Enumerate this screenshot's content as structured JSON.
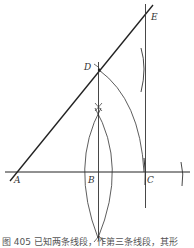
{
  "figure": {
    "caption": "图 405  已知两条线段，作第三条线段，其形",
    "points": {
      "A": {
        "label": "A",
        "x": 14,
        "y": 172
      },
      "B": {
        "label": "B",
        "x": 98,
        "y": 172
      },
      "C": {
        "label": "C",
        "x": 145,
        "y": 172
      },
      "D": {
        "label": "D",
        "x": 99,
        "y": 70
      },
      "E": {
        "label": "E",
        "x": 146,
        "y": 15
      }
    },
    "line_color": "#222222",
    "arc_color": "#333333"
  }
}
